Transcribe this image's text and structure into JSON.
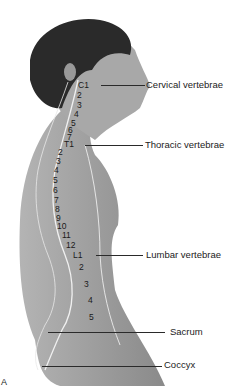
{
  "figure": {
    "panel_letter": "A",
    "regions": [
      {
        "id": "cervical",
        "label": "Cervical vertebrae",
        "y": 85
      },
      {
        "id": "thoracic",
        "label": "Thoracic vertebrae",
        "y": 145
      },
      {
        "id": "lumbar",
        "label": "Lumbar vertebrae",
        "y": 255
      },
      {
        "id": "sacrum",
        "label": "Sacrum",
        "y": 332
      },
      {
        "id": "coccyx",
        "label": "Coccyx",
        "y": 366
      }
    ],
    "vertebra_numbers": {
      "cervical": [
        "C1",
        "2",
        "3",
        "4",
        "5",
        "6",
        "7"
      ],
      "thoracic": [
        "T1",
        "2",
        "3",
        "4",
        "5",
        "6",
        "7",
        "8",
        "9",
        "10",
        "11",
        "12"
      ],
      "lumbar": [
        "L1",
        "2",
        "3",
        "4",
        "5"
      ]
    }
  }
}
